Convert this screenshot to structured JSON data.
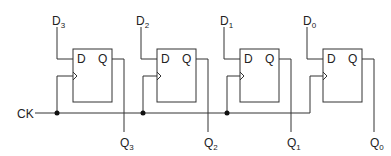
{
  "diagram": {
    "type": "circuit",
    "colors": {
      "line": "#333333",
      "background": "#ffffff"
    },
    "clock": {
      "label": "CK"
    },
    "flipflops": [
      {
        "id": "ff3",
        "input_label": "D",
        "input_sub": "3",
        "pin_d": "D",
        "pin_q": "Q",
        "output_label": "Q",
        "output_sub": "3"
      },
      {
        "id": "ff2",
        "input_label": "D",
        "input_sub": "2",
        "pin_d": "D",
        "pin_q": "Q",
        "output_label": "Q",
        "output_sub": "2"
      },
      {
        "id": "ff1",
        "input_label": "D",
        "input_sub": "1",
        "pin_d": "D",
        "pin_q": "Q",
        "output_label": "Q",
        "output_sub": "1"
      },
      {
        "id": "ff0",
        "input_label": "D",
        "input_sub": "0",
        "pin_d": "D",
        "pin_q": "Q",
        "output_label": "Q",
        "output_sub": "0"
      }
    ]
  }
}
